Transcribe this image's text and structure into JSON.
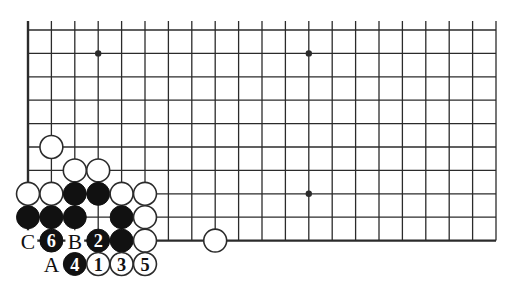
{
  "figure": {
    "kind": "go-board-diagram",
    "background_color": "#ffffff",
    "line_color": "#2b2b2b",
    "black_stone_color": "#111111",
    "white_stone_color": "#ffffff",
    "white_stone_outline": "#2b2b2b",
    "label_color": "#111111"
  },
  "board": {
    "left_px": 28,
    "top_px": 30,
    "step_px": 23.4,
    "cols": 21,
    "rows": 10,
    "edges": {
      "left": true,
      "top": false,
      "bottom": true,
      "right": false
    },
    "star_points": [
      {
        "col": 3,
        "row": 1
      },
      {
        "col": 12,
        "row": 1
      },
      {
        "col": 3,
        "row": 7
      },
      {
        "col": 12,
        "row": 7
      }
    ]
  },
  "stones": [
    {
      "col": 1,
      "row": 5,
      "color": "white",
      "label": ""
    },
    {
      "col": 2,
      "row": 6,
      "color": "white",
      "label": ""
    },
    {
      "col": 3,
      "row": 6,
      "color": "white",
      "label": ""
    },
    {
      "col": 0,
      "row": 7,
      "color": "white",
      "label": ""
    },
    {
      "col": 1,
      "row": 7,
      "color": "white",
      "label": ""
    },
    {
      "col": 2,
      "row": 7,
      "color": "black",
      "label": ""
    },
    {
      "col": 3,
      "row": 7,
      "color": "black",
      "label": ""
    },
    {
      "col": 4,
      "row": 7,
      "color": "white",
      "label": ""
    },
    {
      "col": 5,
      "row": 7,
      "color": "white",
      "label": ""
    },
    {
      "col": 0,
      "row": 8,
      "color": "black",
      "label": ""
    },
    {
      "col": 1,
      "row": 8,
      "color": "black",
      "label": ""
    },
    {
      "col": 2,
      "row": 8,
      "color": "black",
      "label": ""
    },
    {
      "col": 4,
      "row": 8,
      "color": "black",
      "label": ""
    },
    {
      "col": 5,
      "row": 8,
      "color": "white",
      "label": ""
    },
    {
      "col": 1,
      "row": 9,
      "color": "black",
      "label": "6"
    },
    {
      "col": 3,
      "row": 9,
      "color": "black",
      "label": "2"
    },
    {
      "col": 4,
      "row": 9,
      "color": "black",
      "label": ""
    },
    {
      "col": 5,
      "row": 9,
      "color": "white",
      "label": ""
    },
    {
      "col": 2,
      "row": 10,
      "color": "black",
      "label": "4"
    },
    {
      "col": 3,
      "row": 10,
      "color": "white",
      "label": "1"
    },
    {
      "col": 4,
      "row": 10,
      "color": "white",
      "label": "3"
    },
    {
      "col": 5,
      "row": 10,
      "color": "white",
      "label": "5"
    },
    {
      "col": 8,
      "row": 9,
      "color": "white",
      "label": ""
    }
  ],
  "point_labels": [
    {
      "col": 0,
      "row": 9,
      "text": "C"
    },
    {
      "col": 2,
      "row": 9,
      "text": "B"
    },
    {
      "col": 1,
      "row": 10,
      "text": "A"
    }
  ],
  "move_sequence": [
    {
      "number": "1",
      "color": "white"
    },
    {
      "number": "2",
      "color": "black"
    },
    {
      "number": "3",
      "color": "white"
    },
    {
      "number": "4",
      "color": "black"
    },
    {
      "number": "5",
      "color": "white"
    },
    {
      "number": "6",
      "color": "black"
    }
  ]
}
